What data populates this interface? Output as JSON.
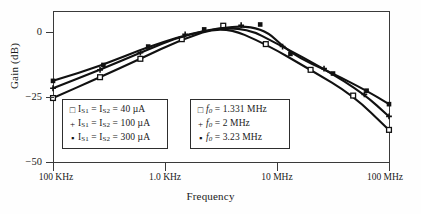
{
  "chart_data": {
    "type": "line",
    "title": "",
    "xlabel": "Frequency",
    "ylabel": "Gain  (dB)",
    "xscale": "log",
    "grid": false,
    "legend_position": "inside-bottom",
    "yticks": [
      "0",
      "−25",
      "−50"
    ],
    "ytick_values": [
      0,
      -25,
      -50
    ],
    "ylim": [
      -57,
      5
    ],
    "xticks": [
      "100 KHz",
      "1.0 KHz",
      "10 MHz",
      "100 MHz"
    ],
    "xtick_values": [
      0,
      1,
      2,
      3
    ],
    "xlim": [
      0,
      3
    ],
    "series": [
      {
        "name": "I_S1 = I_S2 = 40 µA",
        "marker": "open-square",
        "f0": "1.331 MHz",
        "peak_gain_db": -1.0,
        "peak_x": 1.52,
        "points": [
          {
            "x": 0.0,
            "y": -30.5
          },
          {
            "x": 0.42,
            "y": -22.0
          },
          {
            "x": 0.78,
            "y": -14.5
          },
          {
            "x": 1.15,
            "y": -6.5
          },
          {
            "x": 1.52,
            "y": -1.0
          },
          {
            "x": 1.9,
            "y": -8.5
          },
          {
            "x": 2.3,
            "y": -19.0
          },
          {
            "x": 2.68,
            "y": -29.5
          },
          {
            "x": 3.0,
            "y": -43.5
          }
        ]
      },
      {
        "name": "I_S1 = I_S2 = 100 µA",
        "marker": "plus",
        "f0": "2 MHz",
        "peak_gain_db": -0.8,
        "peak_x": 1.68,
        "points": [
          {
            "x": 0.0,
            "y": -26.5
          },
          {
            "x": 0.42,
            "y": -19.0
          },
          {
            "x": 0.78,
            "y": -12.0
          },
          {
            "x": 1.18,
            "y": -4.5
          },
          {
            "x": 1.68,
            "y": -0.8
          },
          {
            "x": 2.05,
            "y": -9.5
          },
          {
            "x": 2.42,
            "y": -18.5
          },
          {
            "x": 2.78,
            "y": -29.0
          },
          {
            "x": 3.0,
            "y": -38.0
          }
        ]
      },
      {
        "name": "I_S1 = I_S2 = 300 µA",
        "marker": "filled-square",
        "f0": "3.23 MHz",
        "peak_gain_db": -0.5,
        "peak_x": 1.85,
        "points": [
          {
            "x": 0.0,
            "y": -23.5
          },
          {
            "x": 0.45,
            "y": -17.0
          },
          {
            "x": 0.85,
            "y": -9.5
          },
          {
            "x": 1.35,
            "y": -2.5
          },
          {
            "x": 1.85,
            "y": -0.5
          },
          {
            "x": 2.12,
            "y": -12.5
          },
          {
            "x": 2.5,
            "y": -20.5
          },
          {
            "x": 2.8,
            "y": -27.5
          },
          {
            "x": 3.0,
            "y": -33.0
          }
        ]
      }
    ]
  },
  "axes": {
    "ylabel": "Gain  (dB)",
    "xlabel": "Frequency",
    "ytick0": "0",
    "ytick1": "−25",
    "ytick2": "−50",
    "xtick0": "100 KHz",
    "xtick1": "1.0 KHz",
    "xtick2": "10 MHz",
    "xtick3": "100 MHz"
  },
  "legend_left": {
    "rows": [
      {
        "marker": "□",
        "pre": "I",
        "sub1": "S1",
        "mid": " = I",
        "sub2": "S2",
        "post": " = 40 µA"
      },
      {
        "marker": "+",
        "pre": "I",
        "sub1": "S1",
        "mid": " = I",
        "sub2": "S2",
        "post": " = 100 µA"
      },
      {
        "marker": "▪",
        "pre": "I",
        "sub1": "S1",
        "mid": " = I",
        "sub2": "S2",
        "post": " = 300 µA"
      }
    ]
  },
  "legend_right": {
    "rows": [
      {
        "marker": "□",
        "sym": "f",
        "sub": "0",
        "post": " = 1.331 MHz"
      },
      {
        "marker": "+",
        "sym": "f",
        "sub": "0",
        "post": " = 2 MHz"
      },
      {
        "marker": "▪",
        "sym": "f",
        "sub": "0",
        "post": " = 3.23 MHz"
      }
    ]
  },
  "colors": {
    "curve": "#111111",
    "axis": "#3a3a3a",
    "background": "#fefefe",
    "text": "#1a1a1a"
  }
}
